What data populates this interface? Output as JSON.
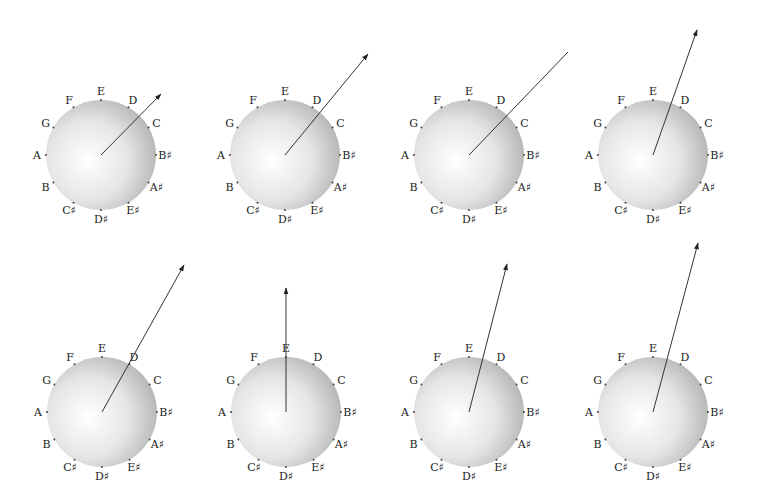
{
  "diagram": {
    "type": "note-circle-vectors",
    "canvas": {
      "width": 759,
      "height": 499
    },
    "radius": 55,
    "note_labels": [
      {
        "name": "B♯",
        "angle": 0
      },
      {
        "name": "C",
        "angle": 30
      },
      {
        "name": "D",
        "angle": 60
      },
      {
        "name": "E",
        "angle": 90
      },
      {
        "name": "F",
        "angle": 120
      },
      {
        "name": "G",
        "angle": 150
      },
      {
        "name": "A",
        "angle": 180
      },
      {
        "name": "B",
        "angle": 210
      },
      {
        "name": "C♯",
        "angle": 240
      },
      {
        "name": "D♯",
        "angle": 270
      },
      {
        "name": "E♯",
        "angle": 300
      },
      {
        "name": "A♯",
        "angle": 330
      }
    ],
    "colors": {
      "circle_center": "#ffffff",
      "circle_edge": "#b8b8b8",
      "arrow": "#333333",
      "label": "#222222"
    },
    "panels": [
      {
        "id": 1,
        "cx": 101,
        "cy": 155,
        "tip_x": 161,
        "tip_y": 94,
        "arrowhead": true
      },
      {
        "id": 2,
        "cx": 285,
        "cy": 155,
        "tip_x": 368,
        "tip_y": 54,
        "arrowhead": true
      },
      {
        "id": 3,
        "cx": 469,
        "cy": 155,
        "tip_x": 568,
        "tip_y": 52,
        "arrowhead": false
      },
      {
        "id": 4,
        "cx": 653,
        "cy": 155,
        "tip_x": 697,
        "tip_y": 30,
        "arrowhead": true
      },
      {
        "id": 5,
        "cx": 102,
        "cy": 412,
        "tip_x": 184,
        "tip_y": 265,
        "arrowhead": true
      },
      {
        "id": 6,
        "cx": 286,
        "cy": 412,
        "tip_x": 286,
        "tip_y": 288,
        "arrowhead": true
      },
      {
        "id": 7,
        "cx": 469,
        "cy": 412,
        "tip_x": 507,
        "tip_y": 264,
        "arrowhead": true
      },
      {
        "id": 8,
        "cx": 653,
        "cy": 412,
        "tip_x": 698,
        "tip_y": 243,
        "arrowhead": true
      }
    ]
  }
}
